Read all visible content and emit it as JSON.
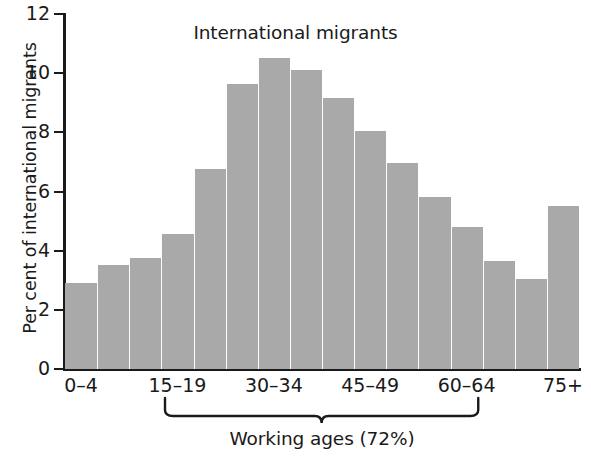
{
  "chart_data": {
    "type": "bar",
    "title": "International migrants",
    "xlabel": "",
    "ylabel": "Per cent of international migrants",
    "ylim": [
      0,
      12
    ],
    "yticks": [
      0,
      2,
      4,
      6,
      8,
      10,
      12
    ],
    "ytick_labels": [
      "0",
      "2",
      "4",
      "6",
      "8",
      "10",
      "12"
    ],
    "grid": false,
    "legend": "none",
    "categories": [
      "0–4",
      "5–9",
      "10–14",
      "15–19",
      "20–24",
      "25–29",
      "30–34",
      "35–39",
      "40–44",
      "45–49",
      "50–54",
      "55–59",
      "60–64",
      "65–69",
      "70–74",
      "75+"
    ],
    "values": [
      2.9,
      3.5,
      3.75,
      4.55,
      6.75,
      9.65,
      10.5,
      10.1,
      9.15,
      8.05,
      6.95,
      5.8,
      4.8,
      3.65,
      3.05,
      5.5
    ],
    "visible_xtick_labels": [
      "0–4",
      "15–19",
      "30–34",
      "45–49",
      "60–64",
      "75+"
    ],
    "visible_xtick_indices": [
      0,
      3,
      6,
      9,
      12,
      15
    ],
    "bar_color": "#a9a9a9",
    "axis_color": "#1a1a1a",
    "annotation": {
      "label": "Working ages (72%)",
      "spans_categories": [
        "15–19",
        "60–64"
      ],
      "value": "72%"
    }
  }
}
